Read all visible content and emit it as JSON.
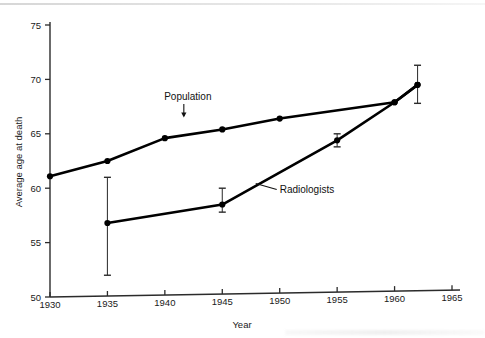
{
  "chart_data": {
    "type": "line",
    "title": "",
    "xlabel": "Year",
    "ylabel": "Average age at death",
    "xlim": [
      1930,
      1965
    ],
    "ylim": [
      50,
      75
    ],
    "xticks": [
      1930,
      1935,
      1940,
      1945,
      1950,
      1955,
      1960,
      1965
    ],
    "xtick_labels": [
      "1930",
      "1935",
      "1940",
      "1945",
      "1950",
      "1955",
      "1960",
      "1965"
    ],
    "yticks": [
      50,
      55,
      60,
      65,
      70,
      75
    ],
    "ytick_labels": [
      "50",
      "55",
      "60",
      "65",
      "70",
      "75"
    ],
    "grid": false,
    "legend": "inline-annotations",
    "series": [
      {
        "name": "Population",
        "label": "Population",
        "color": "#000000",
        "x": [
          1930,
          1935,
          1940,
          1945,
          1950,
          1960,
          1962
        ],
        "y": [
          61.1,
          62.5,
          64.6,
          65.4,
          66.4,
          67.9,
          69.5
        ],
        "errors": [
          null,
          null,
          null,
          null,
          null,
          null,
          null
        ]
      },
      {
        "name": "Radiologists",
        "label": "Radiologists",
        "color": "#000000",
        "x": [
          1935,
          1945,
          1955,
          1960,
          1962
        ],
        "y": [
          56.8,
          58.5,
          64.4,
          67.9,
          69.5
        ],
        "errors": [
          {
            "low": 52.0,
            "high": 61.0
          },
          {
            "low": 57.8,
            "high": 60.0
          },
          {
            "low": 63.8,
            "high": 65.0
          },
          null,
          {
            "low": 67.8,
            "high": 71.3
          }
        ]
      }
    ],
    "annotations": [
      {
        "name": "population-annotation",
        "text": "Population",
        "pointer": "down-arrow",
        "text_x": 1942,
        "text_y": 68.1
      },
      {
        "name": "radiologists-annotation",
        "text": "Radiologists",
        "pointer": "leader-line",
        "text_x": 1950,
        "text_y": 59.6
      }
    ]
  },
  "axes": {
    "x_title": "Year",
    "y_title": "Average age at death"
  }
}
